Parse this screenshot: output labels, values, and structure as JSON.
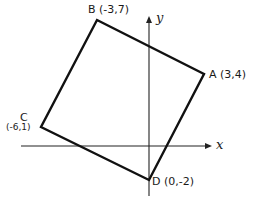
{
  "diagram": {
    "type": "coordinate-plane-square",
    "axes": {
      "x_label": "x",
      "y_label": "y"
    },
    "points": [
      {
        "name": "A",
        "coords": "(3,4)",
        "label": "A (3,4)"
      },
      {
        "name": "B",
        "coords": "(-3,7)",
        "label": "B (-3,7)"
      },
      {
        "name": "C",
        "coords": "(-6,1)",
        "letter": "C",
        "coord_label": "(-6,1)"
      },
      {
        "name": "D",
        "coords": "(0,-2)",
        "label": "D (0,-2)"
      }
    ],
    "polygon_order": [
      "B",
      "A",
      "D",
      "C"
    ],
    "colors": {
      "stroke": "#111111",
      "axis": "#222222",
      "background": "#ffffff"
    }
  }
}
